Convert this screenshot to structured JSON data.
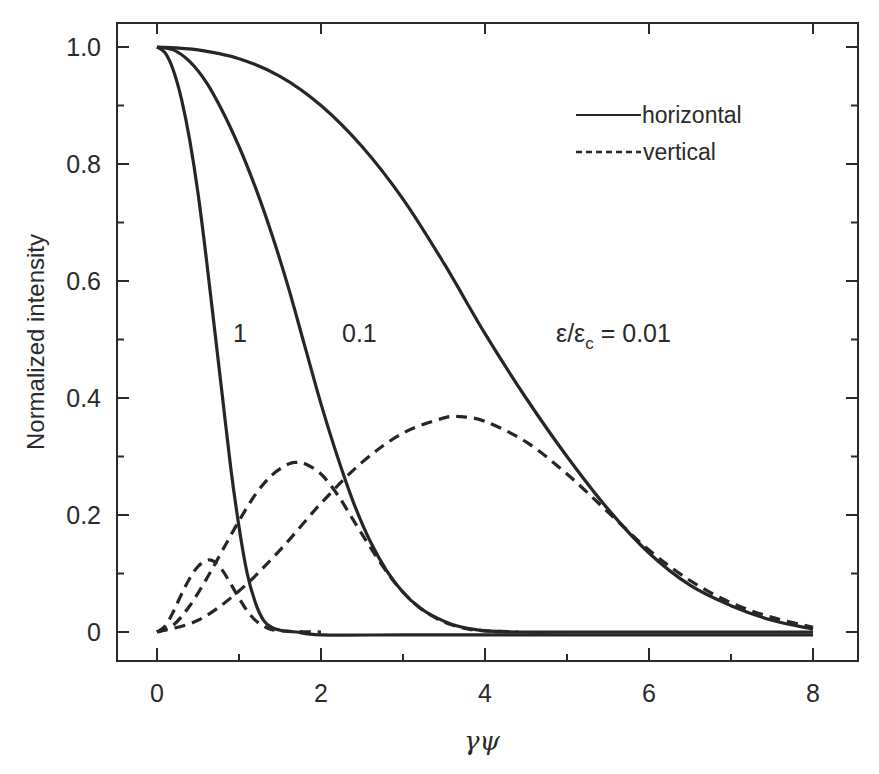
{
  "chart_data": {
    "type": "line",
    "title": "",
    "xlabel": "γψ",
    "ylabel": "Normalized intensity",
    "xlim": [
      -0.5,
      8.5
    ],
    "ylim": [
      -0.05,
      1.05
    ],
    "x_ticks": [
      0,
      2,
      4,
      6,
      8
    ],
    "x_tick_labels": [
      "0",
      "2",
      "4",
      "6",
      "8"
    ],
    "x_minor_ticks": [
      1,
      3,
      5,
      7
    ],
    "y_ticks": [
      0,
      0.2,
      0.4,
      0.6,
      0.8,
      1.0
    ],
    "y_tick_labels": [
      "0",
      "0.2",
      "0.4",
      "0.6",
      "0.8",
      "1.0"
    ],
    "y_minor_ticks": [
      0.1,
      0.3,
      0.5,
      0.7,
      0.9
    ],
    "grid": false,
    "legend": {
      "placement": "top-right",
      "entries": [
        {
          "label": "horizontal",
          "style": "solid"
        },
        {
          "label": "vertical",
          "style": "dashed"
        }
      ]
    },
    "annotations": [
      {
        "text": "1",
        "x": 1.0,
        "y": 0.54
      },
      {
        "text": "0.1",
        "x": 2.55,
        "y": 0.54
      },
      {
        "text_main": "ε/ε",
        "text_sub": "c",
        "text_tail": " = 0.01",
        "x": 4.9,
        "y": 0.54
      }
    ],
    "series": [
      {
        "name": "horizontal ε/εc = 1",
        "style": "solid",
        "x": [
          0,
          0.1,
          0.2,
          0.3,
          0.4,
          0.5,
          0.6,
          0.7,
          0.8,
          0.9,
          1.0,
          1.1,
          1.2,
          1.3,
          1.4,
          1.5,
          1.7,
          2.0,
          3.0,
          4.0,
          5.0,
          6.0,
          7.0,
          8.0
        ],
        "y": [
          1.0,
          0.99,
          0.96,
          0.91,
          0.84,
          0.75,
          0.64,
          0.52,
          0.4,
          0.28,
          0.18,
          0.1,
          0.05,
          0.02,
          0.008,
          0.003,
          0.0,
          -0.005,
          -0.005,
          -0.005,
          -0.005,
          -0.005,
          -0.005,
          -0.005
        ]
      },
      {
        "name": "horizontal ε/εc = 0.1",
        "style": "solid",
        "x": [
          0,
          0.2,
          0.4,
          0.6,
          0.8,
          1.0,
          1.2,
          1.4,
          1.6,
          1.8,
          2.0,
          2.2,
          2.4,
          2.6,
          2.8,
          3.0,
          3.2,
          3.4,
          3.6,
          3.8,
          4.0,
          4.4,
          5.0,
          6.0,
          7.0,
          8.0
        ],
        "y": [
          1.0,
          0.995,
          0.975,
          0.94,
          0.89,
          0.83,
          0.76,
          0.68,
          0.59,
          0.49,
          0.39,
          0.3,
          0.22,
          0.155,
          0.105,
          0.068,
          0.042,
          0.025,
          0.013,
          0.006,
          0.002,
          0.0,
          0.0,
          0.0,
          0.0,
          0.0
        ]
      },
      {
        "name": "horizontal ε/εc = 0.01",
        "style": "solid",
        "x": [
          0,
          0.5,
          1.0,
          1.5,
          2.0,
          2.5,
          3.0,
          3.5,
          4.0,
          4.5,
          5.0,
          5.5,
          6.0,
          6.5,
          7.0,
          7.5,
          8.0
        ],
        "y": [
          1.0,
          0.995,
          0.98,
          0.95,
          0.9,
          0.83,
          0.74,
          0.63,
          0.51,
          0.4,
          0.3,
          0.21,
          0.135,
          0.08,
          0.045,
          0.02,
          0.005
        ]
      },
      {
        "name": "vertical ε/εc = 1",
        "style": "dashed",
        "x": [
          0,
          0.1,
          0.2,
          0.3,
          0.4,
          0.5,
          0.6,
          0.65,
          0.7,
          0.8,
          0.9,
          1.0,
          1.1,
          1.2,
          1.3,
          1.4,
          1.6,
          2.0
        ],
        "y": [
          0.0,
          0.01,
          0.035,
          0.065,
          0.092,
          0.112,
          0.122,
          0.123,
          0.12,
          0.105,
          0.082,
          0.058,
          0.036,
          0.02,
          0.01,
          0.004,
          0.001,
          0.0
        ]
      },
      {
        "name": "vertical ε/εc = 0.1",
        "style": "dashed",
        "x": [
          0,
          0.2,
          0.4,
          0.6,
          0.8,
          1.0,
          1.2,
          1.4,
          1.6,
          1.7,
          1.8,
          2.0,
          2.2,
          2.4,
          2.6,
          2.8,
          3.0,
          3.2,
          3.4,
          3.6,
          3.8,
          4.0,
          4.4
        ],
        "y": [
          0.0,
          0.012,
          0.045,
          0.09,
          0.14,
          0.19,
          0.235,
          0.268,
          0.287,
          0.29,
          0.288,
          0.27,
          0.235,
          0.19,
          0.145,
          0.103,
          0.068,
          0.042,
          0.024,
          0.012,
          0.005,
          0.002,
          0.0
        ]
      },
      {
        "name": "vertical ε/εc = 0.01",
        "style": "dashed",
        "x": [
          0,
          0.5,
          1.0,
          1.5,
          2.0,
          2.5,
          3.0,
          3.5,
          3.7,
          4.0,
          4.5,
          5.0,
          5.5,
          6.0,
          6.5,
          7.0,
          7.5,
          8.0
        ],
        "y": [
          0.0,
          0.02,
          0.07,
          0.14,
          0.22,
          0.29,
          0.34,
          0.366,
          0.368,
          0.36,
          0.325,
          0.27,
          0.205,
          0.14,
          0.088,
          0.05,
          0.025,
          0.008
        ]
      }
    ]
  }
}
